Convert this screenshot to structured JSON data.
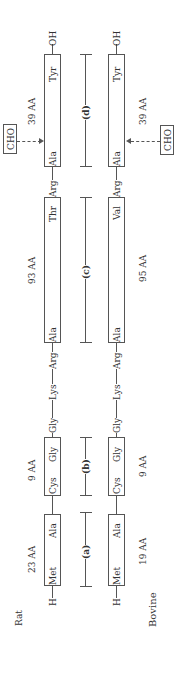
{
  "species": {
    "rat": "Rat",
    "bovine": "Bovine"
  },
  "rat": {
    "n_term": "H",
    "c_term": "OH",
    "segments": [
      {
        "start": "Met",
        "end": "Ala",
        "length": "23 AA"
      },
      {
        "start": "Cys",
        "end": "Gly",
        "length": "9 AA"
      },
      {
        "start": "Ala",
        "end": "Thr",
        "length": "93 AA"
      },
      {
        "start": "Ala",
        "end": "Tyr",
        "length": "39 AA"
      }
    ],
    "linkers": [
      "Gly",
      "Lys",
      "Arg"
    ],
    "linker2": "Arg"
  },
  "bovine": {
    "n_term": "H",
    "c_term": "OH",
    "segments": [
      {
        "start": "Met",
        "end": "Ala",
        "length": "19 AA"
      },
      {
        "start": "Cys",
        "end": "Gly",
        "length": "9 AA"
      },
      {
        "start": "Ala",
        "end": "Val",
        "length": "95 AA"
      },
      {
        "start": "Ala",
        "end": "Tyr",
        "length": "39 AA"
      }
    ],
    "linkers": [
      "Gly",
      "Lys",
      "Arg"
    ],
    "linker2": "Arg"
  },
  "regions": [
    "(a)",
    "(b)",
    "(c)",
    "(d)"
  ],
  "glycosylation": "CHO"
}
